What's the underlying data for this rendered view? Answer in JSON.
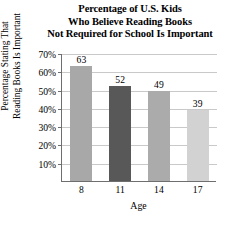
{
  "chart_data": {
    "type": "bar",
    "title": "Percentage of U.S. Kids Who Believe Reading Books Not Required for School Is Important",
    "title_lines": [
      "Percentage of U.S. Kids",
      "Who Believe Reading Books",
      "Not Required for School Is Important"
    ],
    "xlabel": "Age",
    "ylabel": "Percentage Stating That Reading Books Is Important",
    "ylabel_lines": [
      "Percentage Stating That",
      "Reading Books Is Important"
    ],
    "categories": [
      "8",
      "11",
      "14",
      "17"
    ],
    "values": [
      63,
      52,
      49,
      39
    ],
    "value_labels": [
      "63",
      "52",
      "49",
      "39"
    ],
    "ylim": [
      0,
      70
    ],
    "ytick_values": [
      70,
      60,
      50,
      40,
      30,
      20,
      10
    ],
    "ytick_labels": [
      "70%",
      "60%",
      "50%",
      "40%",
      "30%",
      "20%",
      "10%"
    ],
    "grid": true,
    "grid_axis": "y",
    "legend": null,
    "bar_colors": [
      "#a8a8a8",
      "#585858",
      "#ababab",
      "#d2d2d2"
    ],
    "grid_color": "#c9c9c9",
    "axis_color": "#6e6e6e",
    "background_color": "#ffffff"
  }
}
